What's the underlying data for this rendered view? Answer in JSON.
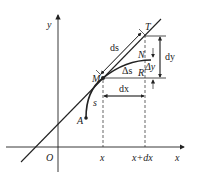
{
  "diagram": {
    "axes": {
      "x_label": "x",
      "y_label": "y",
      "origin_label": "O"
    },
    "points": {
      "M": "M",
      "A": "A",
      "T": "T",
      "N": "N",
      "R": "R"
    },
    "labels": {
      "ds": "ds",
      "delta_s": "Δs",
      "s": "s",
      "dx": "dx",
      "dy": "dy",
      "delta_y": "Δy",
      "x_tick": "x",
      "x_dx_tick": "x+dx"
    },
    "colors": {
      "stroke": "#222222",
      "background": "#ffffff"
    }
  }
}
